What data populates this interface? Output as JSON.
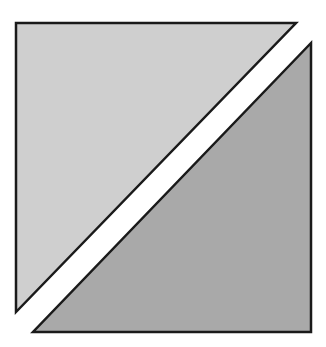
{
  "diagram": {
    "background": "#ffffff",
    "stroke_color": "#1a1a1a",
    "stroke_width": 2.5,
    "shapes": [
      {
        "name": "upper-left-triangle",
        "fill": "#cfcfcf",
        "points": "16,23 296,23 16,312"
      },
      {
        "name": "lower-right-triangle",
        "fill": "#a9a9a9",
        "points": "311,43 311,332 33,332"
      }
    ]
  }
}
